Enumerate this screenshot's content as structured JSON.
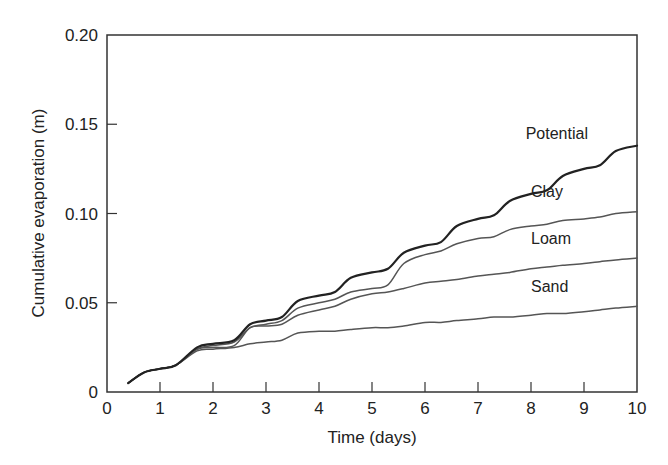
{
  "chart_data": {
    "type": "line",
    "title": "",
    "xlabel": "Time (days)",
    "ylabel": "Cumulative evaporation (m)",
    "xlim": [
      0,
      10
    ],
    "ylim": [
      0,
      0.2
    ],
    "x_ticks": [
      "0",
      "1",
      "2",
      "3",
      "4",
      "5",
      "6",
      "7",
      "8",
      "9",
      "10"
    ],
    "y_ticks": [
      "0",
      "0.05",
      "0.10",
      "0.15",
      "0.20"
    ],
    "grid": false,
    "legend_position": "inline labels near right end of each line",
    "series": [
      {
        "name": "Potential",
        "color": "#222222",
        "width": 2.2,
        "x": [
          0.4,
          0.7,
          1.0,
          1.3,
          1.7,
          2.0,
          2.4,
          2.7,
          3.0,
          3.3,
          3.6,
          4.0,
          4.3,
          4.6,
          5.0,
          5.3,
          5.6,
          6.0,
          6.3,
          6.6,
          7.0,
          7.3,
          7.6,
          8.0,
          8.3,
          8.6,
          9.0,
          9.3,
          9.6,
          10.0
        ],
        "y": [
          0.005,
          0.011,
          0.013,
          0.015,
          0.025,
          0.027,
          0.029,
          0.038,
          0.04,
          0.042,
          0.051,
          0.054,
          0.056,
          0.064,
          0.067,
          0.069,
          0.078,
          0.082,
          0.084,
          0.093,
          0.097,
          0.099,
          0.107,
          0.111,
          0.113,
          0.121,
          0.125,
          0.127,
          0.135,
          0.138
        ]
      },
      {
        "name": "Clay",
        "color": "#555555",
        "width": 1.5,
        "x": [
          0.4,
          0.7,
          1.0,
          1.3,
          1.7,
          2.0,
          2.4,
          2.7,
          3.0,
          3.3,
          3.6,
          4.0,
          4.3,
          4.6,
          5.0,
          5.3,
          5.6,
          6.0,
          6.3,
          6.6,
          7.0,
          7.3,
          7.6,
          8.0,
          8.3,
          8.6,
          9.0,
          9.3,
          9.6,
          10.0
        ],
        "y": [
          0.005,
          0.011,
          0.013,
          0.015,
          0.024,
          0.026,
          0.028,
          0.036,
          0.038,
          0.04,
          0.047,
          0.05,
          0.052,
          0.056,
          0.058,
          0.06,
          0.072,
          0.077,
          0.079,
          0.083,
          0.086,
          0.087,
          0.091,
          0.093,
          0.094,
          0.096,
          0.097,
          0.098,
          0.1,
          0.101
        ]
      },
      {
        "name": "Loam",
        "color": "#555555",
        "width": 1.5,
        "x": [
          0.4,
          0.7,
          1.0,
          1.3,
          1.7,
          2.0,
          2.4,
          2.7,
          3.0,
          3.3,
          3.6,
          4.0,
          4.3,
          4.6,
          5.0,
          5.3,
          5.6,
          6.0,
          6.3,
          6.6,
          7.0,
          7.3,
          7.6,
          8.0,
          8.3,
          8.6,
          9.0,
          9.3,
          9.6,
          10.0
        ],
        "y": [
          0.005,
          0.011,
          0.013,
          0.015,
          0.024,
          0.025,
          0.026,
          0.036,
          0.037,
          0.038,
          0.043,
          0.046,
          0.048,
          0.052,
          0.055,
          0.056,
          0.058,
          0.061,
          0.062,
          0.063,
          0.065,
          0.066,
          0.067,
          0.069,
          0.07,
          0.071,
          0.072,
          0.073,
          0.074,
          0.075
        ]
      },
      {
        "name": "Sand",
        "color": "#555555",
        "width": 1.5,
        "x": [
          0.4,
          0.7,
          1.0,
          1.3,
          1.7,
          2.0,
          2.4,
          2.7,
          3.0,
          3.3,
          3.6,
          4.0,
          4.3,
          4.6,
          5.0,
          5.3,
          5.6,
          6.0,
          6.3,
          6.6,
          7.0,
          7.3,
          7.6,
          8.0,
          8.3,
          8.6,
          9.0,
          9.3,
          9.6,
          10.0
        ],
        "y": [
          0.005,
          0.011,
          0.013,
          0.015,
          0.023,
          0.024,
          0.025,
          0.027,
          0.028,
          0.029,
          0.033,
          0.034,
          0.034,
          0.035,
          0.036,
          0.036,
          0.037,
          0.039,
          0.039,
          0.04,
          0.041,
          0.042,
          0.042,
          0.043,
          0.044,
          0.044,
          0.045,
          0.046,
          0.047,
          0.048
        ]
      }
    ],
    "annotations": [
      {
        "text": "Potential",
        "x": 7.9,
        "y": 0.142
      },
      {
        "text": "Clay",
        "x": 8.0,
        "y": 0.109
      },
      {
        "text": "Loam",
        "x": 8.0,
        "y": 0.083
      },
      {
        "text": "Sand",
        "x": 8.0,
        "y": 0.056
      }
    ]
  },
  "plot_frame": {
    "left": 107,
    "right": 637,
    "top": 35,
    "bottom": 392,
    "frame_color": "#333333"
  }
}
